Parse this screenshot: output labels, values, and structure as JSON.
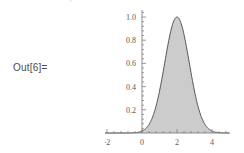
{
  "notebook": {
    "out_label": "Out[6]=",
    "cut_glyph_above": "+"
  },
  "chart_data": {
    "type": "area",
    "title": "",
    "xlabel": "",
    "ylabel": "",
    "xlim": [
      -5.6,
      5.0
    ],
    "ylim": [
      0,
      1.06
    ],
    "xticks": [
      -4,
      -2,
      0,
      2,
      4
    ],
    "xtick_labels": [
      "-4",
      "-2",
      "0",
      "2",
      "4"
    ],
    "yticks": [
      0.2,
      0.4,
      0.6,
      0.8,
      1.0
    ],
    "ytick_labels": [
      "0.2",
      "0.4",
      "0.6",
      "0.8",
      "1.0"
    ],
    "grid": false,
    "legend": "none",
    "fill_color": "#cccccc",
    "line_color": "#555555",
    "axis_color": "#808080",
    "series": [
      {
        "name": "gaussian",
        "description": "Gaussian bell curve peaking at 1.0",
        "mean": 2.0,
        "sigma": 0.7,
        "peak": 1.0,
        "x": [
          -5.6,
          -5.0,
          -4.0,
          -3.0,
          -2.0,
          -1.0,
          -0.5,
          0.0,
          0.25,
          0.5,
          0.75,
          1.0,
          1.25,
          1.5,
          1.75,
          2.0,
          2.25,
          2.5,
          2.75,
          3.0,
          3.25,
          3.5,
          3.75,
          4.0,
          4.5,
          5.0
        ],
        "y": [
          0.0,
          0.0,
          0.0,
          0.0,
          0.0,
          0.0,
          0.002,
          0.008,
          0.018,
          0.037,
          0.07,
          0.123,
          0.2,
          0.301,
          0.42,
          0.545,
          0.66,
          0.755,
          0.82,
          0.86,
          0.86,
          0.82,
          0.755,
          0.66,
          0.42,
          0.2
        ]
      }
    ]
  }
}
